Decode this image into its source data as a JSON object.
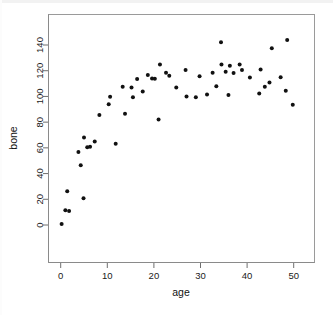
{
  "chart_data": {
    "type": "scatter",
    "title": "",
    "xlabel": "age",
    "ylabel": "bone",
    "xlim": [
      -1.5,
      52
    ],
    "ylim": [
      -4,
      147
    ],
    "xticks": [
      0,
      10,
      20,
      30,
      40,
      50
    ],
    "yticks": [
      0,
      20,
      40,
      60,
      80,
      100,
      120,
      140
    ],
    "xtick_labels": [
      "0",
      "10",
      "20",
      "30",
      "40",
      "50"
    ],
    "ytick_labels": [
      "0",
      "20",
      "40",
      "60",
      "80",
      "100",
      "120",
      "140"
    ],
    "grid": false,
    "legend": null,
    "marker": "filled-circle",
    "marker_color": "#111111",
    "marker_size": 2.0,
    "n_points": 62,
    "x": [
      0.2,
      1.0,
      1.4,
      1.8,
      2.6,
      3.8,
      4.7,
      5.0,
      5.6,
      6.4,
      7.4,
      8.3,
      10.3,
      10.6,
      11.8,
      13.3,
      13.8,
      15.2,
      15.5,
      17.6,
      18.6,
      19.2,
      20.2,
      21.0,
      21.3,
      22.6,
      23.3,
      24.8,
      26.5,
      27.0,
      27.6,
      29.0,
      30.1,
      31.4,
      32.3,
      33.6,
      34.4,
      34.5,
      35.4,
      36.0,
      36.3,
      37.1,
      37.7,
      38.4,
      38.9,
      39.6,
      40.4,
      41.2,
      42.6,
      43.0,
      43.8,
      44.6,
      45.3,
      45.8,
      46.7,
      47.5,
      48.3,
      48.6,
      49.8
    ],
    "y": [
      0.8,
      11.5,
      26.3,
      10.8,
      11.0,
      56.8,
      46.5,
      20.8,
      68.0,
      60.5,
      60.8,
      65.0,
      85.5,
      63.2,
      99.8,
      94.0,
      107.5,
      86.6,
      99.3,
      107.2,
      113.5,
      116.6,
      103.8,
      114.0,
      124.8,
      82.0,
      118.5,
      116.0,
      107.0,
      120.5,
      100.0,
      99.3,
      115.7,
      101.5,
      118.4,
      108.0,
      142.2,
      124.8,
      119.2,
      101.2,
      123.8,
      118.2,
      124.8,
      120.5,
      114.8,
      102.3,
      121.0,
      107.5,
      137.5,
      110.8,
      115.0,
      104.5,
      143.8,
      93.5,
      114.0,
      113.5,
      117.0,
      116.2,
      112.0
    ],
    "points": [
      {
        "age": 0.2,
        "bone": 0.8
      },
      {
        "age": 1.0,
        "bone": 11.5
      },
      {
        "age": 1.4,
        "bone": 26.3
      },
      {
        "age": 1.8,
        "bone": 10.8
      },
      {
        "age": 3.8,
        "bone": 56.8
      },
      {
        "age": 4.3,
        "bone": 46.5
      },
      {
        "age": 4.9,
        "bone": 20.8
      },
      {
        "age": 5.0,
        "bone": 68.0
      },
      {
        "age": 5.7,
        "bone": 60.5
      },
      {
        "age": 6.3,
        "bone": 60.8
      },
      {
        "age": 7.3,
        "bone": 65.0
      },
      {
        "age": 8.3,
        "bone": 85.5
      },
      {
        "age": 10.3,
        "bone": 94.0
      },
      {
        "age": 10.6,
        "bone": 99.8
      },
      {
        "age": 11.8,
        "bone": 63.2
      },
      {
        "age": 13.3,
        "bone": 107.5
      },
      {
        "age": 13.8,
        "bone": 86.6
      },
      {
        "age": 15.2,
        "bone": 107.0
      },
      {
        "age": 15.5,
        "bone": 99.3
      },
      {
        "age": 16.4,
        "bone": 113.5
      },
      {
        "age": 17.6,
        "bone": 103.8
      },
      {
        "age": 18.7,
        "bone": 116.6
      },
      {
        "age": 19.6,
        "bone": 114.0
      },
      {
        "age": 20.2,
        "bone": 113.8
      },
      {
        "age": 21.0,
        "bone": 82.0
      },
      {
        "age": 21.3,
        "bone": 124.8
      },
      {
        "age": 22.6,
        "bone": 118.5
      },
      {
        "age": 23.3,
        "bone": 116.0
      },
      {
        "age": 24.8,
        "bone": 107.0
      },
      {
        "age": 26.8,
        "bone": 120.5
      },
      {
        "age": 27.0,
        "bone": 100.0
      },
      {
        "age": 29.0,
        "bone": 99.3
      },
      {
        "age": 29.8,
        "bone": 115.7
      },
      {
        "age": 31.4,
        "bone": 101.5
      },
      {
        "age": 32.6,
        "bone": 118.4
      },
      {
        "age": 33.4,
        "bone": 108.0
      },
      {
        "age": 34.4,
        "bone": 142.2
      },
      {
        "age": 34.5,
        "bone": 124.8
      },
      {
        "age": 35.4,
        "bone": 119.2
      },
      {
        "age": 36.0,
        "bone": 101.2
      },
      {
        "age": 36.3,
        "bone": 123.8
      },
      {
        "age": 37.1,
        "bone": 118.2
      },
      {
        "age": 38.4,
        "bone": 124.8
      },
      {
        "age": 38.9,
        "bone": 120.5
      },
      {
        "age": 40.6,
        "bone": 114.8
      },
      {
        "age": 42.6,
        "bone": 102.3
      },
      {
        "age": 42.9,
        "bone": 121.0
      },
      {
        "age": 43.8,
        "bone": 107.5
      },
      {
        "age": 44.8,
        "bone": 110.8
      },
      {
        "age": 45.3,
        "bone": 137.5
      },
      {
        "age": 47.2,
        "bone": 115.0
      },
      {
        "age": 48.3,
        "bone": 104.5
      },
      {
        "age": 48.6,
        "bone": 143.8
      },
      {
        "age": 49.8,
        "bone": 93.5
      }
    ]
  },
  "plot": {
    "xlabel": "age",
    "ylabel": "bone"
  }
}
